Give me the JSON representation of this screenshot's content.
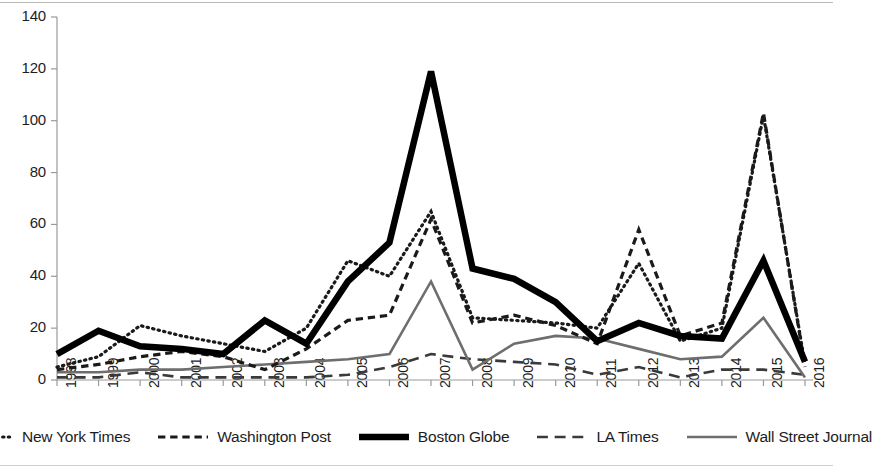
{
  "chart_data": {
    "type": "line",
    "title": "",
    "xlabel": "",
    "ylabel": "",
    "ylim": [
      0,
      140
    ],
    "ytick_step": 20,
    "yticks": [
      0,
      20,
      40,
      60,
      80,
      100,
      120,
      140
    ],
    "grid": false,
    "legend_position": "bottom",
    "categories": [
      "1998",
      "1999",
      "2000",
      "2001",
      "2002",
      "2003",
      "2004",
      "2005",
      "2006",
      "2007",
      "2008",
      "2009",
      "2010",
      "2011",
      "2012",
      "2013",
      "2014",
      "2015",
      "2016"
    ],
    "series": [
      {
        "name": "New York Times",
        "style": "dotted",
        "color": "#1a1a1a",
        "width": 3.2,
        "values": [
          5,
          9,
          21,
          17,
          14,
          11,
          20,
          46,
          40,
          65,
          24,
          23,
          22,
          20,
          45,
          15,
          20,
          102,
          6
        ]
      },
      {
        "name": "Washington Post",
        "style": "dashed",
        "color": "#1a1a1a",
        "width": 3.2,
        "values": [
          4,
          6,
          9,
          11,
          9,
          4,
          12,
          23,
          25,
          62,
          22,
          25,
          21,
          14,
          58,
          17,
          22,
          103,
          5
        ]
      },
      {
        "name": "Boston Globe",
        "style": "solid",
        "color": "#000000",
        "width": 6.5,
        "values": [
          10,
          19,
          13,
          12,
          10,
          23,
          14,
          38,
          53,
          119,
          43,
          39,
          30,
          15,
          22,
          17,
          16,
          46,
          7
        ]
      },
      {
        "name": "LA Times",
        "style": "longdash",
        "color": "#3a3a3a",
        "width": 2.6,
        "values": [
          1,
          1,
          3,
          1,
          1,
          1,
          1,
          2,
          5,
          10,
          8,
          7,
          6,
          2,
          5,
          1,
          4,
          4,
          2
        ]
      },
      {
        "name": "Wall Street Journal",
        "style": "solid",
        "color": "#6e6e6e",
        "width": 2.6,
        "values": [
          3,
          3,
          4,
          4,
          5,
          6,
          7,
          8,
          10,
          38,
          4,
          14,
          17,
          16,
          12,
          8,
          9,
          24,
          1
        ]
      }
    ]
  },
  "axes": {
    "y_tick_labels": [
      "0",
      "20",
      "40",
      "60",
      "80",
      "100",
      "120",
      "140"
    ],
    "x_tick_labels": [
      "1998",
      "1999",
      "2000",
      "2001",
      "2002",
      "2003",
      "2004",
      "2005",
      "2006",
      "2007",
      "2008",
      "2009",
      "2010",
      "2011",
      "2012",
      "2013",
      "2014",
      "2015",
      "2016"
    ]
  },
  "legend": {
    "items": [
      {
        "label": "New York Times",
        "swatch": "dotted-line-swatch"
      },
      {
        "label": "Washington Post",
        "swatch": "dashed-line-swatch"
      },
      {
        "label": "Boston Globe",
        "swatch": "thick-solid-line-swatch"
      },
      {
        "label": "LA Times",
        "swatch": "thin-solid-line-swatch"
      },
      {
        "label": "Wall Street Journal",
        "swatch": "gray-solid-line-swatch"
      }
    ]
  }
}
